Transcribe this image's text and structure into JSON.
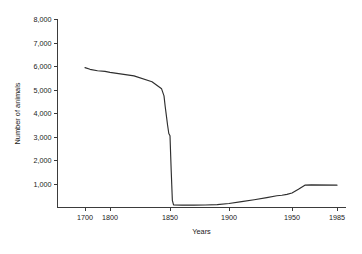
{
  "chart_data": {
    "type": "line",
    "title": "",
    "xlabel": "Years",
    "ylabel": "Number of animals",
    "grid": false,
    "legend": "none",
    "xlim": [
      1690,
      1985
    ],
    "ylim": [
      0,
      8000
    ],
    "x_tick_labels": [
      "1700",
      "1800",
      "1850",
      "1900",
      "1950",
      "1985"
    ],
    "x_ticks": [
      1700,
      1800,
      1850,
      1900,
      1950,
      1985
    ],
    "y_tick_labels": [
      "1,000",
      "2,000",
      "3,000",
      "4,000",
      "5,000",
      "6,000",
      "7,000",
      "8,000"
    ],
    "y_ticks": [
      1000,
      2000,
      3000,
      4000,
      5000,
      6000,
      7000,
      8000
    ],
    "line_color": "#2e2e2e",
    "series": [
      {
        "name": "Number of animals",
        "x": [
          1700,
          1720,
          1750,
          1780,
          1800,
          1820,
          1835,
          1843,
          1845,
          1846,
          1847,
          1848,
          1849,
          1850,
          1851,
          1852,
          1853,
          1860,
          1870,
          1880,
          1890,
          1900,
          1910,
          1920,
          1930,
          1938,
          1942,
          1946,
          1950,
          1955,
          1960,
          1965,
          1985
        ],
        "y": [
          5950,
          5880,
          5820,
          5790,
          5750,
          5600,
          5350,
          5050,
          4750,
          4300,
          3900,
          3500,
          3150,
          3050,
          1600,
          300,
          110,
          100,
          100,
          105,
          120,
          170,
          250,
          330,
          420,
          500,
          520,
          560,
          620,
          780,
          950,
          960,
          950
        ]
      }
    ]
  },
  "axes": {
    "x_title": "Years",
    "y_title": "Number of animals"
  }
}
